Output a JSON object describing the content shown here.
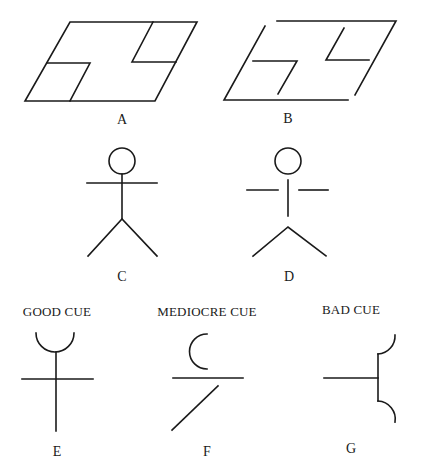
{
  "figure": {
    "panels": [
      {
        "id": "A",
        "label": "A",
        "description": "Closed parallelogram with two L-shaped internal notches"
      },
      {
        "id": "B",
        "label": "B",
        "description": "Same parallelogram with gaps in the outline at the corners"
      },
      {
        "id": "C",
        "label": "C",
        "description": "Stick figure with connected parts"
      },
      {
        "id": "D",
        "label": "D",
        "description": "Stick figure with disconnected parts"
      },
      {
        "id": "E",
        "label": "E",
        "caption": "GOOD CUE",
        "description": "Cup on a vertical stem crossed by a horizontal line"
      },
      {
        "id": "F",
        "label": "F",
        "caption": "MEDIOCRE CUE",
        "description": "Open C-arc above a horizontal line with a diagonal below"
      },
      {
        "id": "G",
        "label": "G",
        "caption": "BAD CUE",
        "description": "Horizontal line meeting a vertical bar capped by two outward arcs"
      }
    ],
    "colors": {
      "stroke": "#1a1a1a",
      "background": "#ffffff"
    }
  }
}
